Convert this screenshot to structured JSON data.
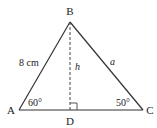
{
  "diagram": {
    "type": "triangle-with-altitude",
    "vertices": {
      "A": {
        "label": "A",
        "x": 19,
        "y": 110
      },
      "B": {
        "label": "B",
        "x": 70,
        "y": 22
      },
      "C": {
        "label": "C",
        "x": 143,
        "y": 110
      },
      "D": {
        "label": "D",
        "x": 70,
        "y": 110
      }
    },
    "side_AB_label": "8 cm",
    "side_BC_label": "a",
    "altitude_label": "h",
    "angle_A_label": "60°",
    "angle_C_label": "50°",
    "colors": {
      "stroke": "#333333",
      "text": "#222222",
      "background": "#ffffff"
    }
  }
}
